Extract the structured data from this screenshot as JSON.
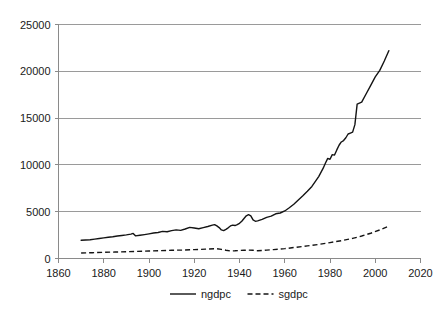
{
  "chart_data": {
    "type": "line",
    "title": "",
    "xlabel": "",
    "ylabel": "",
    "xlim": [
      1860,
      2020
    ],
    "ylim": [
      0,
      25000
    ],
    "xticks": [
      1860,
      1880,
      1900,
      1920,
      1940,
      1960,
      1980,
      2000,
      2020
    ],
    "yticks": [
      0,
      5000,
      10000,
      15000,
      20000,
      25000
    ],
    "xtick_labels": [
      "1860",
      "1880",
      "1900",
      "1920",
      "1940",
      "1960",
      "1980",
      "2000",
      "2020"
    ],
    "ytick_labels": [
      "0",
      "5000",
      "10000",
      "15000",
      "20000",
      "25000"
    ],
    "grid": "horizontal",
    "legend_position": "bottom-center",
    "series": [
      {
        "name": "ngdpc",
        "style": "solid",
        "color": "#141414",
        "x": [
          1870,
          1872,
          1874,
          1876,
          1878,
          1880,
          1882,
          1884,
          1886,
          1888,
          1890,
          1892,
          1893,
          1894,
          1896,
          1898,
          1900,
          1902,
          1904,
          1906,
          1908,
          1910,
          1912,
          1914,
          1916,
          1918,
          1920,
          1922,
          1924,
          1926,
          1928,
          1929,
          1930,
          1931,
          1932,
          1933,
          1934,
          1935,
          1936,
          1937,
          1938,
          1939,
          1940,
          1941,
          1942,
          1943,
          1944,
          1945,
          1946,
          1947,
          1948,
          1950,
          1952,
          1954,
          1956,
          1958,
          1960,
          1962,
          1964,
          1966,
          1968,
          1970,
          1972,
          1974,
          1975,
          1976,
          1977,
          1978,
          1979,
          1980,
          1981,
          1982,
          1983,
          1984,
          1985,
          1986,
          1987,
          1988,
          1989,
          1990,
          1991,
          1992,
          1994,
          1996,
          1998,
          2000,
          2002,
          2004,
          2006
        ],
        "values": [
          1950,
          1980,
          2000,
          2070,
          2130,
          2200,
          2270,
          2320,
          2400,
          2460,
          2520,
          2600,
          2680,
          2420,
          2480,
          2550,
          2630,
          2720,
          2780,
          2900,
          2860,
          2980,
          3060,
          3010,
          3150,
          3320,
          3260,
          3180,
          3300,
          3420,
          3560,
          3620,
          3480,
          3300,
          3050,
          2980,
          3120,
          3280,
          3480,
          3560,
          3520,
          3620,
          3760,
          3980,
          4280,
          4560,
          4680,
          4560,
          4120,
          3980,
          4020,
          4180,
          4400,
          4520,
          4780,
          4860,
          5080,
          5420,
          5800,
          6250,
          6700,
          7180,
          7700,
          8400,
          8750,
          9200,
          9650,
          10200,
          10700,
          10600,
          11100,
          11050,
          11600,
          12100,
          12450,
          12600,
          12900,
          13300,
          13400,
          13500,
          14300,
          16500,
          16700,
          17600,
          18500,
          19400,
          20100,
          21100,
          22200
        ]
      },
      {
        "name": "sgdpc",
        "style": "dashed",
        "color": "#141414",
        "x": [
          1870,
          1875,
          1880,
          1885,
          1890,
          1895,
          1900,
          1905,
          1910,
          1915,
          1920,
          1925,
          1930,
          1932,
          1934,
          1936,
          1938,
          1940,
          1942,
          1944,
          1946,
          1948,
          1950,
          1952,
          1955,
          1960,
          1965,
          1970,
          1975,
          1980,
          1985,
          1990,
          1994,
          1998,
          2002,
          2006
        ],
        "values": [
          580,
          620,
          660,
          690,
          720,
          760,
          800,
          840,
          880,
          900,
          950,
          1000,
          1050,
          980,
          880,
          800,
          820,
          860,
          880,
          900,
          880,
          830,
          860,
          900,
          950,
          1050,
          1200,
          1350,
          1500,
          1700,
          1900,
          2150,
          2400,
          2700,
          3050,
          3450
        ]
      }
    ]
  },
  "legend": {
    "items": [
      {
        "label": "ngdpc",
        "style": "solid"
      },
      {
        "label": "sgdpc",
        "style": "dashed"
      }
    ]
  }
}
